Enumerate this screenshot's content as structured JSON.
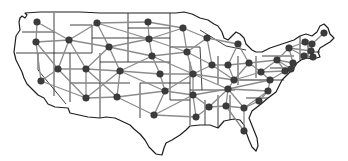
{
  "map": {
    "title": "US state adjacency graph",
    "colors": {
      "outline": "#1e1e1e",
      "edge": "#8c8c8c",
      "node": "#3c3c3c",
      "background": "#ffffff"
    },
    "nodes": [
      {
        "id": "WA",
        "x": 37,
        "y": 22
      },
      {
        "id": "OR",
        "x": 36,
        "y": 42
      },
      {
        "id": "CA",
        "x": 41,
        "y": 81
      },
      {
        "id": "ID",
        "x": 69,
        "y": 40
      },
      {
        "id": "NV",
        "x": 58,
        "y": 69
      },
      {
        "id": "MT",
        "x": 97,
        "y": 23
      },
      {
        "id": "WY",
        "x": 109,
        "y": 47
      },
      {
        "id": "UT",
        "x": 86,
        "y": 69
      },
      {
        "id": "AZ",
        "x": 86,
        "y": 98
      },
      {
        "id": "CO",
        "x": 120,
        "y": 71
      },
      {
        "id": "NM",
        "x": 117,
        "y": 97
      },
      {
        "id": "ND",
        "x": 148,
        "y": 22
      },
      {
        "id": "SD",
        "x": 149,
        "y": 39
      },
      {
        "id": "NE",
        "x": 152,
        "y": 56
      },
      {
        "id": "KS",
        "x": 160,
        "y": 74
      },
      {
        "id": "OK",
        "x": 165,
        "y": 91
      },
      {
        "id": "TX",
        "x": 154,
        "y": 115
      },
      {
        "id": "MN",
        "x": 183,
        "y": 28
      },
      {
        "id": "IA",
        "x": 187,
        "y": 52
      },
      {
        "id": "MO",
        "x": 193,
        "y": 74
      },
      {
        "id": "AR",
        "x": 193,
        "y": 95
      },
      {
        "id": "LA",
        "x": 196,
        "y": 117
      },
      {
        "id": "WI",
        "x": 207,
        "y": 38
      },
      {
        "id": "IL",
        "x": 212,
        "y": 65
      },
      {
        "id": "MS",
        "x": 209,
        "y": 107
      },
      {
        "id": "MI",
        "x": 238,
        "y": 44
      },
      {
        "id": "IN",
        "x": 228,
        "y": 65
      },
      {
        "id": "KY",
        "x": 234,
        "y": 80
      },
      {
        "id": "TN",
        "x": 228,
        "y": 89
      },
      {
        "id": "AL",
        "x": 226,
        "y": 106
      },
      {
        "id": "OH",
        "x": 249,
        "y": 63
      },
      {
        "id": "GA",
        "x": 244,
        "y": 108
      },
      {
        "id": "FL",
        "x": 244,
        "y": 131
      },
      {
        "id": "WV",
        "x": 261,
        "y": 72
      },
      {
        "id": "VA",
        "x": 270,
        "y": 80
      },
      {
        "id": "NC",
        "x": 268,
        "y": 91
      },
      {
        "id": "SC",
        "x": 259,
        "y": 101
      },
      {
        "id": "PA",
        "x": 277,
        "y": 60
      },
      {
        "id": "MD",
        "x": 285,
        "y": 71
      },
      {
        "id": "DE",
        "x": 291,
        "y": 69
      },
      {
        "id": "NJ",
        "x": 293,
        "y": 63
      },
      {
        "id": "NY",
        "x": 289,
        "y": 48
      },
      {
        "id": "CT",
        "x": 304,
        "y": 56
      },
      {
        "id": "RI",
        "x": 313,
        "y": 57
      },
      {
        "id": "MA",
        "x": 311,
        "y": 51
      },
      {
        "id": "VT",
        "x": 305,
        "y": 42
      },
      {
        "id": "NH",
        "x": 312,
        "y": 44
      },
      {
        "id": "ME",
        "x": 324,
        "y": 33
      }
    ],
    "edges": [
      [
        "WA",
        "OR"
      ],
      [
        "WA",
        "ID"
      ],
      [
        "OR",
        "ID"
      ],
      [
        "OR",
        "NV"
      ],
      [
        "OR",
        "CA"
      ],
      [
        "CA",
        "NV"
      ],
      [
        "CA",
        "AZ"
      ],
      [
        "ID",
        "NV"
      ],
      [
        "ID",
        "UT"
      ],
      [
        "ID",
        "MT"
      ],
      [
        "ID",
        "WY"
      ],
      [
        "NV",
        "UT"
      ],
      [
        "NV",
        "AZ"
      ],
      [
        "MT",
        "WY"
      ],
      [
        "MT",
        "ND"
      ],
      [
        "MT",
        "SD"
      ],
      [
        "WY",
        "SD"
      ],
      [
        "WY",
        "NE"
      ],
      [
        "WY",
        "CO"
      ],
      [
        "WY",
        "UT"
      ],
      [
        "UT",
        "CO"
      ],
      [
        "UT",
        "AZ"
      ],
      [
        "UT",
        "NM"
      ],
      [
        "AZ",
        "NM"
      ],
      [
        "AZ",
        "CO"
      ],
      [
        "CO",
        "NM"
      ],
      [
        "CO",
        "NE"
      ],
      [
        "CO",
        "KS"
      ],
      [
        "CO",
        "OK"
      ],
      [
        "NM",
        "OK"
      ],
      [
        "NM",
        "TX"
      ],
      [
        "ND",
        "SD"
      ],
      [
        "ND",
        "MN"
      ],
      [
        "SD",
        "NE"
      ],
      [
        "SD",
        "MN"
      ],
      [
        "SD",
        "IA"
      ],
      [
        "NE",
        "KS"
      ],
      [
        "NE",
        "IA"
      ],
      [
        "NE",
        "MO"
      ],
      [
        "KS",
        "OK"
      ],
      [
        "KS",
        "MO"
      ],
      [
        "OK",
        "TX"
      ],
      [
        "OK",
        "MO"
      ],
      [
        "OK",
        "AR"
      ],
      [
        "TX",
        "AR"
      ],
      [
        "TX",
        "LA"
      ],
      [
        "MN",
        "IA"
      ],
      [
        "MN",
        "WI"
      ],
      [
        "IA",
        "WI"
      ],
      [
        "IA",
        "IL"
      ],
      [
        "IA",
        "MO"
      ],
      [
        "MO",
        "IL"
      ],
      [
        "MO",
        "KY"
      ],
      [
        "MO",
        "TN"
      ],
      [
        "MO",
        "AR"
      ],
      [
        "AR",
        "LA"
      ],
      [
        "AR",
        "MS"
      ],
      [
        "AR",
        "TN"
      ],
      [
        "LA",
        "MS"
      ],
      [
        "WI",
        "IL"
      ],
      [
        "WI",
        "MI"
      ],
      [
        "IL",
        "IN"
      ],
      [
        "IL",
        "KY"
      ],
      [
        "MI",
        "IN"
      ],
      [
        "MI",
        "OH"
      ],
      [
        "IN",
        "OH"
      ],
      [
        "IN",
        "KY"
      ],
      [
        "KY",
        "OH"
      ],
      [
        "KY",
        "WV"
      ],
      [
        "KY",
        "VA"
      ],
      [
        "KY",
        "TN"
      ],
      [
        "TN",
        "VA"
      ],
      [
        "TN",
        "NC"
      ],
      [
        "TN",
        "GA"
      ],
      [
        "TN",
        "AL"
      ],
      [
        "TN",
        "MS"
      ],
      [
        "MS",
        "AL"
      ],
      [
        "AL",
        "GA"
      ],
      [
        "AL",
        "FL"
      ],
      [
        "GA",
        "FL"
      ],
      [
        "GA",
        "SC"
      ],
      [
        "GA",
        "NC"
      ],
      [
        "SC",
        "NC"
      ],
      [
        "NC",
        "VA"
      ],
      [
        "OH",
        "WV"
      ],
      [
        "OH",
        "PA"
      ],
      [
        "WV",
        "VA"
      ],
      [
        "WV",
        "PA"
      ],
      [
        "WV",
        "MD"
      ],
      [
        "VA",
        "MD"
      ],
      [
        "PA",
        "MD"
      ],
      [
        "PA",
        "DE"
      ],
      [
        "PA",
        "NJ"
      ],
      [
        "PA",
        "NY"
      ],
      [
        "MD",
        "DE"
      ],
      [
        "DE",
        "NJ"
      ],
      [
        "NJ",
        "NY"
      ],
      [
        "NY",
        "CT"
      ],
      [
        "NY",
        "MA"
      ],
      [
        "NY",
        "VT"
      ],
      [
        "CT",
        "MA"
      ],
      [
        "CT",
        "RI"
      ],
      [
        "RI",
        "MA"
      ],
      [
        "MA",
        "VT"
      ],
      [
        "MA",
        "NH"
      ],
      [
        "VT",
        "NH"
      ],
      [
        "NH",
        "ME"
      ]
    ]
  }
}
